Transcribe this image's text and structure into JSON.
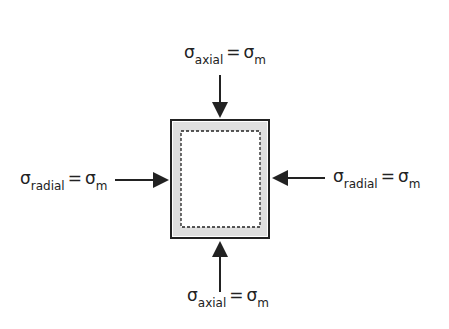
{
  "labels": {
    "top": {
      "symbol": "σ",
      "sub": "axial",
      "eq": "=",
      "rhs_symbol": "σ",
      "rhs_sub": "m"
    },
    "bottom": {
      "symbol": "σ",
      "sub": "axial",
      "eq": "=",
      "rhs_symbol": "σ",
      "rhs_sub": "m"
    },
    "left": {
      "symbol": "σ",
      "sub": "radial",
      "eq": "=",
      "rhs_symbol": "σ",
      "rhs_sub": "m"
    },
    "right": {
      "symbol": "σ",
      "sub": "radial",
      "eq": "=",
      "rhs_symbol": "σ",
      "rhs_sub": "m"
    }
  },
  "colors": {
    "stroke": "#222222",
    "shading": "#cfcfcf"
  }
}
